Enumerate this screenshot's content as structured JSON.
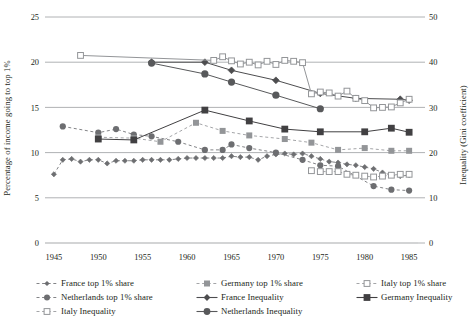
{
  "chart_data": {
    "type": "line",
    "title": "",
    "xlabel": "",
    "ylabel": "Percentage of income going to top 1%",
    "ylabel_right": "Inequality (Gini coefficient)",
    "xlim": [
      1944,
      1986
    ],
    "ylim": [
      0,
      25
    ],
    "ylim_right": [
      0,
      50
    ],
    "xticks": [
      1945,
      1950,
      1955,
      1960,
      1965,
      1970,
      1975,
      1980,
      1985
    ],
    "yticks": [
      0,
      5,
      10,
      15,
      20,
      25
    ],
    "yticks_right": [
      0,
      10,
      20,
      30,
      40,
      50
    ],
    "grid": "horizontal",
    "legend_position": "below",
    "series": [
      {
        "name": "France top 1% share",
        "axis": "left",
        "marker": "diamond-small-filled",
        "line": "dashed",
        "color": "#6d6e71",
        "x": [
          1945,
          1946,
          1947,
          1948,
          1949,
          1950,
          1951,
          1952,
          1953,
          1954,
          1955,
          1956,
          1957,
          1958,
          1959,
          1960,
          1961,
          1962,
          1963,
          1964,
          1965,
          1966,
          1967,
          1968,
          1969,
          1970,
          1971,
          1972,
          1973,
          1974,
          1975,
          1976,
          1977,
          1978,
          1979,
          1980,
          1981,
          1982,
          1983,
          1984,
          1985
        ],
        "y": [
          7.6,
          9.2,
          9.3,
          9.0,
          9.2,
          9.2,
          8.8,
          9.1,
          9.1,
          9.1,
          9.2,
          9.2,
          9.2,
          9.2,
          9.3,
          9.4,
          9.4,
          9.4,
          9.4,
          9.4,
          9.6,
          9.5,
          9.5,
          9.2,
          9.6,
          9.8,
          9.9,
          9.8,
          9.9,
          9.6,
          9.3,
          9.0,
          8.9,
          8.7,
          8.6,
          8.4,
          8.2,
          7.8,
          7.5,
          7.4,
          7.5
        ]
      },
      {
        "name": "Netherlands top 1% share",
        "axis": "left",
        "marker": "circle-filled",
        "line": "dashed",
        "color": "#6d6e71",
        "x": [
          1946,
          1950,
          1952,
          1954,
          1956,
          1959,
          1962,
          1964,
          1965,
          1967,
          1970,
          1973,
          1975,
          1977,
          1981,
          1983,
          1985
        ],
        "y": [
          12.9,
          12.2,
          12.6,
          12.0,
          11.8,
          11.2,
          10.3,
          10.3,
          10.9,
          10.5,
          10.0,
          9.2,
          8.6,
          8.5,
          6.3,
          5.9,
          5.8
        ]
      },
      {
        "name": "Germany top 1% share",
        "axis": "left",
        "marker": "square-filled-light",
        "line": "dashed",
        "color": "#939598",
        "x": [
          1950,
          1954,
          1957,
          1961,
          1964,
          1967,
          1971,
          1974,
          1977,
          1980,
          1983,
          1985
        ],
        "y": [
          11.7,
          11.6,
          11.2,
          13.3,
          12.4,
          11.9,
          11.5,
          11.1,
          10.3,
          10.5,
          10.2,
          10.2
        ]
      },
      {
        "name": "Italy top 1% share",
        "axis": "left",
        "marker": "square-open",
        "line": "dashed",
        "color": "#939598",
        "x": [
          1974,
          1975,
          1976,
          1977,
          1978,
          1979,
          1980,
          1981,
          1982,
          1983,
          1984,
          1985
        ],
        "y": [
          8.0,
          7.9,
          7.9,
          7.9,
          7.6,
          7.5,
          7.4,
          7.3,
          7.4,
          7.5,
          7.6,
          7.6
        ]
      },
      {
        "name": "France Inequality",
        "axis": "right",
        "marker": "diamond-filled",
        "line": "solid",
        "color": "#4d4d4f",
        "x": [
          1956,
          1962,
          1965,
          1970,
          1975,
          1979,
          1984,
          1985
        ],
        "y": [
          40.0,
          40.0,
          38.2,
          36.0,
          33.1,
          32.0,
          31.8,
          31.6
        ]
      },
      {
        "name": "Netherlands Inequality",
        "axis": "right",
        "marker": "circle-filled-large",
        "line": "solid",
        "color": "#58595b",
        "x": [
          1956,
          1962,
          1965,
          1970,
          1975
        ],
        "y": [
          39.8,
          37.4,
          35.6,
          32.7,
          29.7
        ]
      },
      {
        "name": "Germany Inequality",
        "axis": "right",
        "marker": "square-filled-dark",
        "line": "solid",
        "color": "#414042",
        "x": [
          1950,
          1954,
          1962,
          1967,
          1971,
          1975,
          1980,
          1983,
          1985
        ],
        "y": [
          23.0,
          22.8,
          29.4,
          27.0,
          25.2,
          24.6,
          24.6,
          25.4,
          24.5
        ]
      },
      {
        "name": "Italy Inequality",
        "axis": "right",
        "marker": "square-open",
        "line": "solid",
        "color": "#939598",
        "x": [
          1948,
          1963,
          1964,
          1965,
          1966,
          1967,
          1968,
          1969,
          1970,
          1971,
          1972,
          1973,
          1974,
          1975,
          1976,
          1977,
          1978,
          1979,
          1980,
          1981,
          1982,
          1983,
          1984,
          1985
        ],
        "y": [
          41.5,
          40.4,
          41.2,
          40.3,
          39.6,
          40.0,
          39.4,
          40.2,
          39.5,
          40.4,
          40.2,
          39.9,
          33.0,
          33.4,
          33.2,
          32.5,
          33.6,
          32.0,
          31.5,
          29.9,
          30.0,
          30.1,
          31.0,
          31.8
        ]
      }
    ]
  },
  "legend": {
    "items": [
      {
        "label": "France top 1% share",
        "marker": "diamond-small-filled",
        "line": "dashed",
        "color": "#6d6e71"
      },
      {
        "label": "Germany top 1% share",
        "marker": "square-filled-light",
        "line": "dashed",
        "color": "#939598"
      },
      {
        "label": "Italy top 1% share",
        "marker": "square-open",
        "line": "dashed",
        "color": "#939598"
      },
      {
        "label": "Netherlands top 1% share",
        "marker": "circle-filled",
        "line": "dashed",
        "color": "#6d6e71"
      },
      {
        "label": "France Inequality",
        "marker": "diamond-filled",
        "line": "solid",
        "color": "#4d4d4f"
      },
      {
        "label": "Germany Inequality",
        "marker": "square-filled-dark",
        "line": "solid",
        "color": "#414042"
      },
      {
        "label": "Italy Inequality",
        "marker": "square-open",
        "line": "dashed",
        "color": "#939598"
      },
      {
        "label": "Netherlands Inequality",
        "marker": "circle-filled-large",
        "line": "solid",
        "color": "#58595b"
      }
    ]
  },
  "colors": {
    "gridline": "#a7a9ac",
    "axis": "#6d6e71",
    "text": "#231f20"
  }
}
